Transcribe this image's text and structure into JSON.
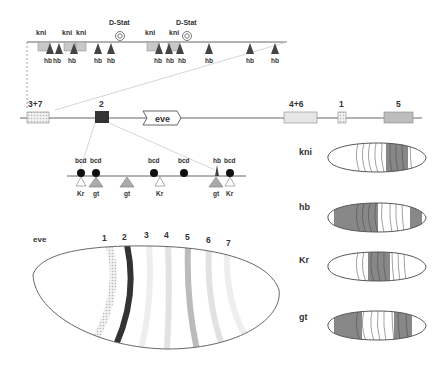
{
  "top_enhancer": {
    "kni_labels": [
      "kni",
      "kni",
      "kni",
      "kni",
      "kni"
    ],
    "dstat_labels": [
      "D-Stat",
      "D-Stat"
    ],
    "hb_labels": [
      "hb",
      "hb",
      "hb",
      "hb",
      "hb",
      "hb",
      "hb",
      "hb",
      "hb",
      "hb",
      "hb",
      "hb"
    ]
  },
  "locus": {
    "enhancers": [
      {
        "label": "3+7",
        "color": "#e4e4e4"
      },
      {
        "label": "2",
        "color": "#333333"
      },
      {
        "label": "4+6",
        "color": "#e6e6e6"
      },
      {
        "label": "1",
        "color": "#eeeeee"
      },
      {
        "label": "5",
        "color": "#bdbdbd"
      }
    ],
    "gene": "eve"
  },
  "stripe2_enhancer": {
    "top_labels": [
      "bcd",
      "bcd",
      "bcd",
      "bcd",
      "hb",
      "bcd"
    ],
    "bottom_labels": [
      "Kr",
      "gt",
      "gt",
      "Kr",
      "gt",
      "Kr"
    ]
  },
  "eve_embryo": {
    "label": "eve",
    "stripes": [
      "1",
      "2",
      "3",
      "4",
      "5",
      "6",
      "7"
    ]
  },
  "gap_embryos": [
    {
      "label": "kni"
    },
    {
      "label": "hb"
    },
    {
      "label": "Kr"
    },
    {
      "label": "gt"
    }
  ]
}
